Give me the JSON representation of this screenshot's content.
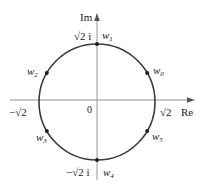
{
  "figure": {
    "colors": {
      "axis": "#8a8a8a",
      "circle": "#3a3a3a",
      "point": "#1e1e1e",
      "text": "#222222"
    },
    "geometry": {
      "center_x": 97,
      "center_y": 102,
      "radius": 58
    },
    "axes": {
      "real_label": "Re",
      "imag_label": "Im",
      "origin_label": "0"
    },
    "tick_labels": {
      "pos_real": "√2",
      "neg_real": "−√2",
      "pos_imag": "√2 i",
      "neg_imag": "−√2 i"
    },
    "points": [
      {
        "name": "w",
        "sub": "0",
        "angle_deg": 30
      },
      {
        "name": "w",
        "sub": "1",
        "angle_deg": 90
      },
      {
        "name": "w",
        "sub": "2",
        "angle_deg": 150
      },
      {
        "name": "w",
        "sub": "3",
        "angle_deg": 210
      },
      {
        "name": "w",
        "sub": "4",
        "angle_deg": 270
      },
      {
        "name": "w",
        "sub": "5",
        "angle_deg": 330
      }
    ]
  }
}
